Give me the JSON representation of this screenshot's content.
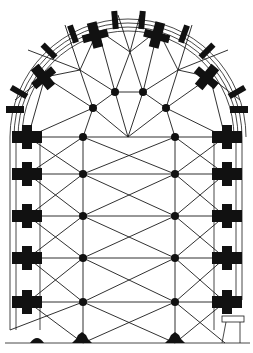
{
  "figure": {
    "type": "architectural-floor-plan",
    "colors": {
      "ink": "#111111",
      "paper": "#ffffff"
    }
  },
  "plan": {
    "apse_center": [
      128,
      137
    ],
    "inner_columns": [
      [
        83,
        137
      ],
      [
        175,
        137
      ],
      [
        83,
        174
      ],
      [
        175,
        174
      ],
      [
        83,
        216
      ],
      [
        175,
        216
      ],
      [
        83,
        258
      ],
      [
        175,
        258
      ],
      [
        83,
        302
      ],
      [
        175,
        302
      ]
    ],
    "apse_columns": [
      [
        93,
        108
      ],
      [
        115,
        92
      ],
      [
        143,
        92
      ],
      [
        166,
        108
      ]
    ],
    "radiating_piers_rows_y": [
      137,
      174,
      216,
      258,
      302
    ],
    "bottom_piers": [
      [
        37,
        343
      ],
      [
        82,
        343
      ],
      [
        175,
        343
      ]
    ]
  }
}
